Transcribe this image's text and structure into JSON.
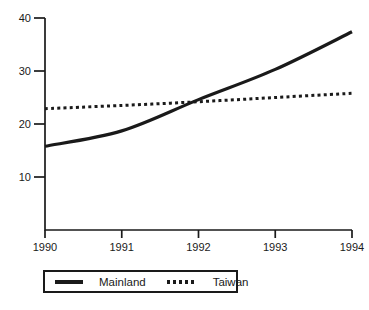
{
  "chart_data": {
    "type": "line",
    "title": "",
    "xlabel": "",
    "ylabel": "",
    "x": [
      1990,
      1991,
      1992,
      1993,
      1994
    ],
    "xticks": [
      "1990",
      "1991",
      "1992",
      "1993",
      "1994"
    ],
    "yticks": [
      10,
      20,
      30,
      40
    ],
    "ylim": [
      0,
      40
    ],
    "grid": false,
    "legend_position": "bottom",
    "ink_color": "#1a1a1a",
    "series": [
      {
        "name": "Mainland",
        "style": "solid",
        "values": [
          15.8,
          18.7,
          24.6,
          30.3,
          37.4
        ]
      },
      {
        "name": "Taiwan",
        "style": "dotted",
        "values": [
          22.9,
          23.5,
          24.2,
          25.0,
          25.8
        ]
      }
    ]
  }
}
